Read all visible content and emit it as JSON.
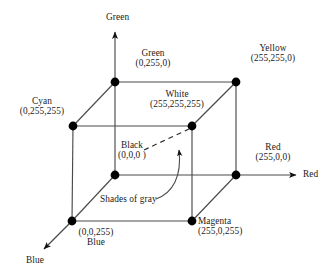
{
  "figure": {
    "type": "rgb-color-cube-diagram",
    "background_color": "#ffffff",
    "line_color": "#3a3a3a",
    "vertex_color": "#000000",
    "text_color": "#1a1a1a"
  },
  "axes": [
    {
      "id": "green-axis",
      "label": "Green"
    },
    {
      "id": "red-axis",
      "label": "Red"
    },
    {
      "id": "blue-axis",
      "label": "Blue"
    }
  ],
  "vertices": [
    {
      "id": "green",
      "name": "Green",
      "coord": "(0,255,0)",
      "rgb": [
        0,
        255,
        0
      ]
    },
    {
      "id": "yellow",
      "name": "Yellow",
      "coord": "(255,255,0)",
      "rgb": [
        255,
        255,
        0
      ]
    },
    {
      "id": "cyan",
      "name": "Cyan",
      "coord": "(0,255,255)",
      "rgb": [
        0,
        255,
        255
      ]
    },
    {
      "id": "white",
      "name": "White",
      "coord": "(255,255,255)",
      "rgb": [
        255,
        255,
        255
      ]
    },
    {
      "id": "black",
      "name": "Black",
      "coord": "(0,0,0 )",
      "rgb": [
        0,
        0,
        0
      ]
    },
    {
      "id": "red",
      "name": "Red",
      "coord": "(255,0,0)",
      "rgb": [
        255,
        0,
        0
      ]
    },
    {
      "id": "blue",
      "name": "Blue",
      "coord": "(0,0,255)",
      "rgb": [
        0,
        0,
        255
      ]
    },
    {
      "id": "magenta",
      "name": "Magenta",
      "coord": "(255,0,255)",
      "rgb": [
        255,
        0,
        255
      ]
    }
  ],
  "annotations": [
    {
      "id": "shades-of-gray",
      "text": "Shades of gray"
    }
  ]
}
